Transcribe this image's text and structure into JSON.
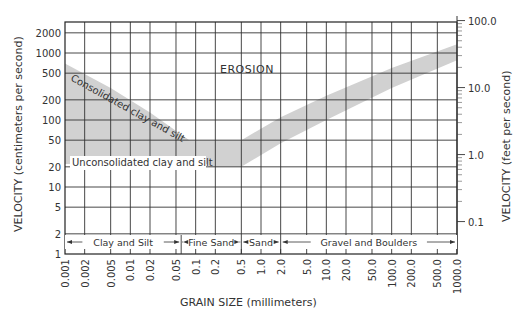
{
  "chart_data": {
    "type": "area",
    "title": "",
    "xlabel": "GRAIN SIZE (millimeters)",
    "ylabel": "VELOCITY (centimeters per second)",
    "ylabel_right": "VELOCITY (feet per second)",
    "xscale": "log",
    "yscale": "log",
    "xlim": [
      0.001,
      1000.0
    ],
    "ylim": [
      1,
      2900
    ],
    "grid": true,
    "x_ticks": [
      "0.001",
      "0.002",
      "0.005",
      "0.01",
      "0.02",
      "0.05",
      "0.1",
      "0.2",
      "0.5",
      "1.0",
      "2.0",
      "5.0",
      "10.0",
      "20.0",
      "50.0",
      "100.0",
      "200.0",
      "500.0",
      "1000.0"
    ],
    "x_tick_values": [
      0.001,
      0.002,
      0.005,
      0.01,
      0.02,
      0.05,
      0.1,
      0.2,
      0.5,
      1,
      2,
      5,
      10,
      20,
      50,
      100,
      200,
      500,
      1000
    ],
    "y_ticks": [
      "1",
      "2",
      "5",
      "10",
      "20",
      "50",
      "100",
      "200",
      "500",
      "1000",
      "2000"
    ],
    "y_tick_values": [
      1,
      2,
      5,
      10,
      20,
      50,
      100,
      200,
      500,
      1000,
      2000
    ],
    "y_right_ticks": [
      "0.1",
      "1.0",
      "10.0",
      "100.0"
    ],
    "y_right_tick_values_fps": [
      0.1,
      1.0,
      10.0,
      100.0
    ],
    "grain_classes": [
      {
        "label": "Clay and Silt",
        "from": 0.001,
        "to": 0.06
      },
      {
        "label": "Fine Sand",
        "from": 0.06,
        "to": 0.5
      },
      {
        "label": "Sand",
        "from": 0.5,
        "to": 2.0
      },
      {
        "label": "Gravel and Boulders",
        "from": 2.0,
        "to": 1000.0
      }
    ],
    "series": [
      {
        "name": "Erosion threshold band (upper edge)",
        "x": [
          0.001,
          0.005,
          0.02,
          0.08,
          0.5,
          2.0,
          10.0,
          100.0,
          1000.0
        ],
        "values": [
          700,
          300,
          130,
          50,
          50,
          110,
          230,
          600,
          1350
        ]
      },
      {
        "name": "Erosion threshold band (lower edge)",
        "x": [
          0.001,
          0.15,
          0.16,
          0.5,
          2.0,
          10.0,
          100.0,
          1000.0
        ],
        "values": [
          22,
          22,
          20,
          20,
          45,
          100,
          300,
          780
        ]
      }
    ],
    "annotations": [
      {
        "text": "EROSION",
        "x": 0.3,
        "y": 300
      },
      {
        "text": "Consolidated clay and silt",
        "x": 0.01,
        "y": 150,
        "rotation": -30
      },
      {
        "text": "Unconsolidated clay and silt",
        "x": 0.01,
        "y": 25
      }
    ]
  },
  "labels": {
    "erosion": "EROSION",
    "consolidated": "Consolidated clay and silt",
    "unconsolidated": "Unconsolidated clay and silt",
    "xlabel": "GRAIN SIZE (millimeters)",
    "ylabel": "VELOCITY (centimeters per second)",
    "ylabel_right": "VELOCITY (feet per second)"
  }
}
